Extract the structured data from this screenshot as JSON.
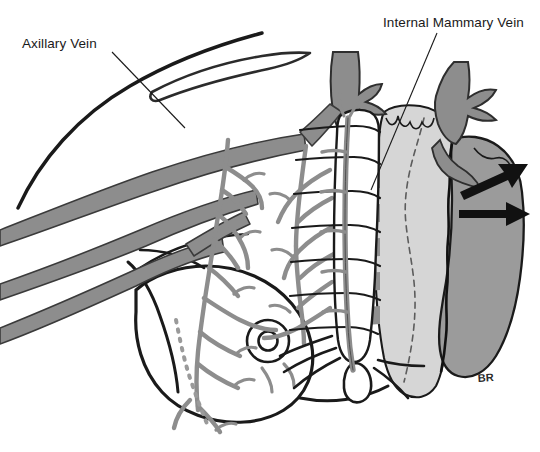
{
  "figure": {
    "signature": "BR",
    "background_color": "#ffffff",
    "width": 540,
    "height": 452
  },
  "labels": [
    {
      "id": "axillary-vein",
      "text": "Axillary Vein",
      "text_x": 22,
      "text_y": 48,
      "leader": "M 112 52 L 185 128"
    },
    {
      "id": "internal-mammary-vein",
      "text": "Internal Mammary Vein",
      "text_x": 383,
      "text_y": 27,
      "leader": "M 437 33 L 371 190"
    }
  ],
  "palette": {
    "ink": "#1a1a1a",
    "vein_gray": "#8d8d8d",
    "vein_outline": "#3a3a3a",
    "lung_light_gray": "#d6d6d6",
    "heart_gray": "#9b9b9b",
    "intercostal_gray": "#8f8f8f",
    "white": "#ffffff",
    "arrow_black": "#111111",
    "lymphatic_dot": "#9a9a9a"
  },
  "structures": [
    {
      "name": "chest-wall-outline",
      "kind": "contour"
    },
    {
      "name": "clavicle",
      "kind": "bone"
    },
    {
      "name": "axillary-vein-trunk",
      "kind": "vein"
    },
    {
      "name": "subclavian-vein-branches",
      "kind": "vein"
    },
    {
      "name": "lateral-thoracic-vein",
      "kind": "vein"
    },
    {
      "name": "breast-mound",
      "kind": "contour"
    },
    {
      "name": "nipple-areola",
      "kind": "contour"
    },
    {
      "name": "breast-venous-plexus",
      "kind": "vein"
    },
    {
      "name": "lymphatic-chain",
      "kind": "dotted"
    },
    {
      "name": "sternum",
      "kind": "bone"
    },
    {
      "name": "costal-cartilages",
      "kind": "bone"
    },
    {
      "name": "intercostal-spaces",
      "kind": "muscle"
    },
    {
      "name": "internal-mammary-vein-trunk",
      "kind": "vein"
    },
    {
      "name": "internal-mammary-perforators",
      "kind": "vein"
    },
    {
      "name": "lung-pleura",
      "kind": "organ"
    },
    {
      "name": "heart",
      "kind": "organ"
    },
    {
      "name": "great-vessels",
      "kind": "vein"
    },
    {
      "name": "flow-arrow-upper",
      "kind": "arrow"
    },
    {
      "name": "flow-arrow-lower",
      "kind": "arrow"
    },
    {
      "name": "xiphoid-process",
      "kind": "bone"
    },
    {
      "name": "costal-margin",
      "kind": "bone"
    }
  ]
}
